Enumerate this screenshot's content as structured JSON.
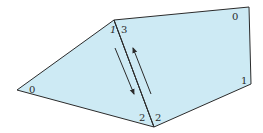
{
  "colors": {
    "fill": "#cdeaf4",
    "stroke": "#2b2b2b",
    "label": "#2a2a2a"
  },
  "left_face": {
    "vertex_labels": [
      {
        "id": "left-vertex-0",
        "text": "0"
      },
      {
        "id": "left-vertex-1",
        "text": "1"
      },
      {
        "id": "left-vertex-2",
        "text": "2"
      }
    ]
  },
  "right_face": {
    "vertex_labels": [
      {
        "id": "right-vertex-3",
        "text": "3"
      },
      {
        "id": "right-vertex-0",
        "text": "0"
      },
      {
        "id": "right-vertex-1",
        "text": "1"
      },
      {
        "id": "right-vertex-2",
        "text": "2"
      }
    ]
  },
  "shared_edge": {
    "arrows": [
      {
        "id": "arrow-down",
        "direction": "down"
      },
      {
        "id": "arrow-up",
        "direction": "up"
      }
    ]
  }
}
